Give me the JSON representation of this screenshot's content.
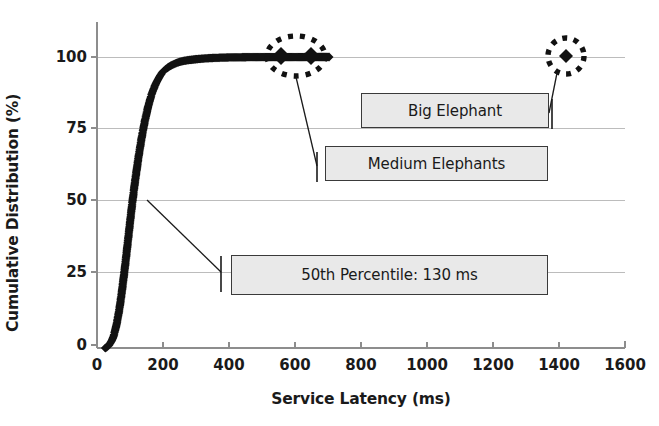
{
  "chart_data": {
    "type": "line",
    "title": "",
    "xlabel": "Service Latency (ms)",
    "ylabel": "Cumulative Distribution (%)",
    "xlim": [
      0,
      1600
    ],
    "ylim": [
      0,
      105
    ],
    "xticks": [
      0,
      200,
      400,
      600,
      800,
      1000,
      1200,
      1400,
      1600
    ],
    "yticks": [
      0,
      25,
      50,
      75,
      100
    ],
    "grid": "horizontal",
    "legend": "none",
    "marker": "filled-diamond",
    "series": [
      {
        "name": "Cumulative Distribution of Service Latency",
        "x": [
          25,
          30,
          35,
          40,
          45,
          50,
          55,
          60,
          65,
          70,
          75,
          80,
          85,
          90,
          95,
          100,
          105,
          110,
          115,
          120,
          125,
          130,
          135,
          140,
          145,
          150,
          155,
          160,
          165,
          170,
          175,
          180,
          185,
          190,
          195,
          200,
          210,
          220,
          230,
          240,
          250,
          260,
          275,
          290,
          305,
          320,
          340,
          360,
          380,
          400,
          420,
          440,
          460,
          480,
          500,
          530,
          560,
          620,
          680,
          1430
        ],
        "y": [
          0.0,
          0.3,
          0.8,
          1.6,
          2.6,
          4.0,
          6.0,
          8.5,
          11.5,
          15.0,
          19.0,
          23.5,
          28.0,
          33.0,
          38.0,
          43.0,
          48.0,
          52.5,
          57.0,
          61.0,
          65.0,
          68.5,
          72.0,
          75.0,
          78.0,
          80.5,
          83.0,
          85.0,
          87.0,
          88.5,
          90.0,
          91.2,
          92.3,
          93.3,
          94.2,
          95.0,
          96.0,
          96.8,
          97.4,
          97.9,
          98.3,
          98.6,
          98.9,
          99.1,
          99.3,
          99.45,
          99.6,
          99.7,
          99.78,
          99.84,
          99.88,
          99.91,
          99.93,
          99.95,
          99.96,
          99.97,
          99.98,
          99.99,
          100.0,
          100.0
        ]
      }
    ],
    "annotations": [
      {
        "id": "p50",
        "label": "50th Percentile: 130 ms",
        "points_to_x": 130,
        "points_to_y": 50
      },
      {
        "id": "medium-elephants",
        "label": "Medium Elephants",
        "highlight": "dotted-ellipse",
        "points_to_x": 600,
        "points_to_y": 100
      },
      {
        "id": "big-elephant",
        "label": "Big Elephant",
        "highlight": "dotted-circle",
        "points_to_x": 1430,
        "points_to_y": 100
      }
    ]
  },
  "axis": {
    "ylabel": "Cumulative Distribution (%)",
    "xlabel": "Service Latency (ms)",
    "xtick_labels": [
      "0",
      "200",
      "400",
      "600",
      "800",
      "1000",
      "1200",
      "1400",
      "1600"
    ],
    "ytick_labels": [
      "0",
      "25",
      "50",
      "75",
      "100"
    ]
  },
  "callouts": {
    "percentile": "50th Percentile: 130 ms",
    "big_elephant": "Big Elephant",
    "medium_elephants": "Medium Elephants"
  },
  "colors": {
    "data": "#111111",
    "grid": "#b8b8b8",
    "axis": "#8a8a8a",
    "box_fill": "#e9e9e9",
    "box_border": "#3a3a3a",
    "text": "#1a1a1a"
  }
}
